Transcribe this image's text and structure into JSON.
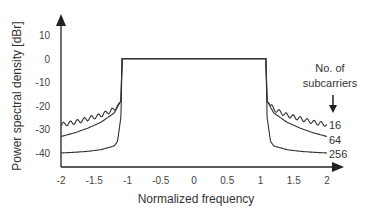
{
  "chart_data": {
    "type": "line",
    "title": "",
    "xlabel": "Normalized frequency",
    "ylabel": "Power spectral density [dBr]",
    "xlim": [
      -2,
      2
    ],
    "ylim": [
      -45,
      15
    ],
    "grid": false,
    "x_ticks": [
      "-2",
      "-1.5",
      "-1",
      "-0.5",
      "0",
      "0.5",
      "1",
      "1.5",
      "2"
    ],
    "y_ticks": [
      "10",
      "0",
      "-10",
      "-20",
      "-30",
      "-40"
    ],
    "legend_title": "No. of subcarriers",
    "legend_position": "right, labels at curve ends",
    "series": [
      {
        "name": "16",
        "x": [
          -2,
          -1.8,
          -1.6,
          -1.4,
          -1.2,
          -1.1,
          -1.08,
          1.08,
          1.1,
          1.2,
          1.4,
          1.6,
          1.8,
          2
        ],
        "values": [
          -28,
          -27,
          -25.5,
          -24,
          -21.5,
          -18,
          0,
          0,
          -18,
          -21.5,
          -24,
          -25.5,
          -27,
          -28
        ],
        "ripple": true
      },
      {
        "name": "64",
        "x": [
          -2,
          -1.8,
          -1.6,
          -1.4,
          -1.2,
          -1.1,
          -1.08,
          1.08,
          1.1,
          1.2,
          1.4,
          1.6,
          1.8,
          2
        ],
        "values": [
          -33,
          -31.5,
          -29.5,
          -27,
          -23,
          -18,
          0,
          0,
          -18,
          -23,
          -27,
          -29.5,
          -31.5,
          -33
        ]
      },
      {
        "name": "256",
        "x": [
          -2,
          -1.8,
          -1.6,
          -1.4,
          -1.2,
          -1.15,
          -1.1,
          -1.08,
          1.08,
          1.1,
          1.15,
          1.2,
          1.4,
          1.6,
          1.8,
          2
        ],
        "values": [
          -40,
          -39.7,
          -39.3,
          -38.6,
          -37,
          -35,
          -25,
          0,
          0,
          -25,
          -35,
          -37,
          -38.6,
          -39.3,
          -39.7,
          -40
        ]
      }
    ]
  },
  "labels": {
    "legend_line1": "No. of",
    "legend_line2": "subcarriers",
    "curve16": "16",
    "curve64": "64",
    "curve256": "256"
  }
}
